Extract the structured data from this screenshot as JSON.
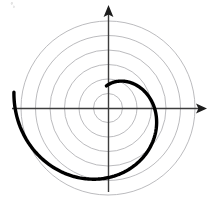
{
  "figure": {
    "title": "",
    "background_color": "#ffffff",
    "width": 214,
    "height": 198
  },
  "chart_data": {
    "type": "line",
    "plot_system": "polar",
    "title": "",
    "subtitle": "",
    "xlabel": "",
    "ylabel": "",
    "grid": true,
    "grid_style": "concentric-circles",
    "legend": false,
    "legend_position": "none",
    "annotations": [],
    "tick_labels": {
      "radial": [],
      "angular": []
    },
    "axes": {
      "origin_px": [
        108,
        108
      ],
      "x_axis": {
        "label": "",
        "arrow": "right",
        "start_px": [
          12,
          108
        ],
        "end_px": [
          206,
          108
        ],
        "color": "#3c3c3c"
      },
      "y_axis": {
        "label": "",
        "arrow": "up",
        "start_px": [
          108,
          192
        ],
        "end_px": [
          108,
          6
        ],
        "color": "#3c3c3c"
      }
    },
    "polar_grid": {
      "color": "#a9a9ad",
      "stroke_width": 0.8,
      "ring_count": 6,
      "ring_radii_px": [
        14.5,
        29,
        43.5,
        58,
        72.5,
        87
      ],
      "ring_radii_units": [
        1,
        2,
        3,
        4,
        5,
        6
      ]
    },
    "series": [
      {
        "name": "spiral",
        "label": "",
        "curve_type": "archimedean-spiral",
        "equation": "r = a*theta",
        "color": "#000000",
        "stroke_width": 3.4,
        "a_units_per_radian": 1.02,
        "theta_start_rad": 1.5,
        "theta_end_rad": 6.45,
        "direction": "counterclockwise",
        "theta_offset_rad": 3.14159,
        "r_range_units": [
          1.5,
          6.6
        ],
        "points_polar": [
          {
            "theta_deg": 86,
            "r_units": 1.5
          },
          {
            "theta_deg": 115,
            "r_units": 2.05
          },
          {
            "theta_deg": 145,
            "r_units": 2.58
          },
          {
            "theta_deg": 175,
            "r_units": 3.11
          },
          {
            "theta_deg": 205,
            "r_units": 3.64
          },
          {
            "theta_deg": 235,
            "r_units": 4.18
          },
          {
            "theta_deg": 265,
            "r_units": 4.71
          },
          {
            "theta_deg": 295,
            "r_units": 5.24
          },
          {
            "theta_deg": 325,
            "r_units": 5.77
          },
          {
            "theta_deg": 355,
            "r_units": 6.3
          },
          {
            "theta_deg": 370,
            "r_units": 6.57
          }
        ],
        "key_features": {
          "inner_endpoint_px": [
            104,
            126
          ],
          "outer_endpoint_px": [
            109,
            193
          ],
          "rightmost_px": [
            160,
            141
          ],
          "positive_x_axis_crossing_px": [
            146,
            108
          ],
          "top_of_loop_px": [
            128,
            99
          ]
        }
      }
    ]
  },
  "artifacts": {
    "corner_speck": "faint-gray-speck-top-left"
  }
}
